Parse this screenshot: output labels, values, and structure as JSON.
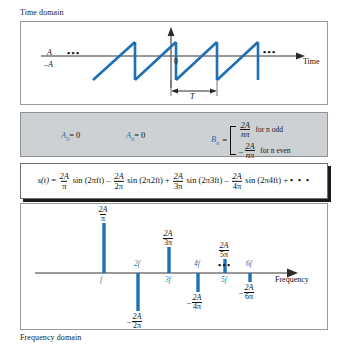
{
  "figure": {
    "top_caption": "Time domain",
    "bottom_caption": "Frequency domain"
  },
  "time_domain": {
    "amplitude_label": "A",
    "neg_amplitude_label": "–A",
    "origin_label": "0",
    "axis_label": "Time",
    "period_label": "T",
    "left_ellipsis": "•••",
    "right_ellipsis": "•••",
    "waveform": "sawtooth",
    "periods_visible": 3
  },
  "coefficients": {
    "a0_label": "A",
    "a0_sub": "0",
    "a0_value": "= 0",
    "an_label": "A",
    "an_sub": "n",
    "an_value": "= 0",
    "bn_label": "B",
    "bn_sub": "n",
    "bn_equals": "=",
    "case_odd_num": "2A",
    "case_odd_den": "nπ",
    "case_odd_cond": "for n odd",
    "case_even_sign": "–",
    "case_even_num": "2A",
    "case_even_den": "nπ",
    "case_even_cond": "for n even"
  },
  "equation": {
    "lhs": "s(t)",
    "eq": "=",
    "t1_num": "2A",
    "t1_den": "π",
    "t1_sin": "sin (2πft)",
    "op1": "–",
    "t2_num": "2A",
    "t2_den": "2π",
    "t2_sin": "sin (2π2ft)",
    "op2": "+",
    "t3_num": "2A",
    "t3_den": "3π",
    "t3_sin": "sin (2π3ft)",
    "op3": "–",
    "t4_num": "2A",
    "t4_den": "4π",
    "t4_sin": "sin (2π4ft)",
    "op4": "+",
    "tail": "• • •"
  },
  "frequency_domain": {
    "axis_label": "Frequency",
    "ellipsis": "•••",
    "harmonics": [
      {
        "freq_label": "f",
        "num": "2A",
        "den": "π",
        "sign": "",
        "direction": "up",
        "x": 83,
        "height": 50
      },
      {
        "freq_label": "2f",
        "num": "2A",
        "den": "2π",
        "sign": "–",
        "direction": "down",
        "x": 117,
        "height": 38
      },
      {
        "freq_label": "3f",
        "num": "2A",
        "den": "3π",
        "sign": "",
        "direction": "up",
        "x": 148,
        "height": 26
      },
      {
        "freq_label": "4f",
        "num": "2A",
        "den": "4π",
        "sign": "–",
        "direction": "down",
        "x": 177,
        "height": 19
      },
      {
        "freq_label": "5f",
        "num": "2A",
        "den": "5π",
        "sign": "",
        "direction": "up",
        "x": 204,
        "height": 14
      },
      {
        "freq_label": "6f",
        "num": "2A",
        "den": "6π",
        "sign": "–",
        "direction": "down",
        "x": 229,
        "height": 9
      }
    ]
  },
  "colors": {
    "curve_blue": "#1f6fb5",
    "label_blue": "#2a6fb0",
    "axis_gray": "#77777a",
    "panel_border": "#9a9a9a",
    "coef_bg": "#cdd1d4",
    "text": "#1a1a1a"
  }
}
